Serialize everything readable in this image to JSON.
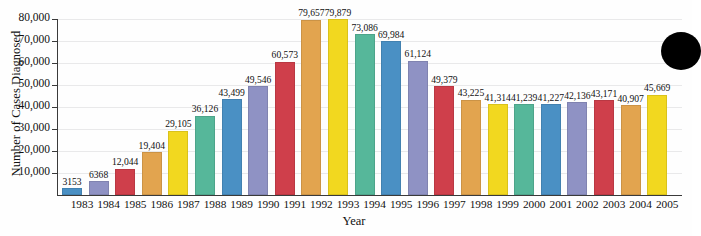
{
  "chart_data": {
    "type": "bar",
    "title": "",
    "xlabel": "Year",
    "ylabel": "Number of Cases Diagnosed",
    "ylim": [
      0,
      80000
    ],
    "ytick_values": [
      10000,
      20000,
      30000,
      40000,
      50000,
      60000,
      70000,
      80000
    ],
    "ytick_labels": [
      "10,000",
      "20,000",
      "30,000",
      "40,000",
      "50,000",
      "60,000",
      "70,000",
      "80,000"
    ],
    "grid": true,
    "legend": "none",
    "categories": [
      "1983",
      "1984",
      "1985",
      "1986",
      "1987",
      "1988",
      "1989",
      "1990",
      "1991",
      "1992",
      "1993",
      "1994",
      "1995",
      "1996",
      "1997",
      "1998",
      "1999",
      "2000",
      "2001",
      "2002",
      "2003",
      "2004",
      "2005"
    ],
    "values": [
      3153,
      6368,
      12044,
      19404,
      29105,
      36126,
      43499,
      49546,
      60573,
      79657,
      79879,
      73086,
      69984,
      61124,
      49379,
      43225,
      41314,
      41239,
      41227,
      42136,
      43171,
      40907,
      45669
    ],
    "value_labels": [
      "3153",
      "6368",
      "12,044",
      "19,404",
      "29,105",
      "36,126",
      "43,499",
      "49,546",
      "60,573",
      "79,657",
      "79,879",
      "73,086",
      "69,984",
      "61,124",
      "49,379",
      "43,225",
      "41,314",
      "41,239",
      "41,227",
      "42,136",
      "43,171",
      "40,907",
      "45,669"
    ],
    "bar_colors": [
      "#4a90c4",
      "#8f92c4",
      "#cf3f4b",
      "#e2a44f",
      "#f2d81f",
      "#56b79a",
      "#4a90c4",
      "#8f92c4",
      "#cf3f4b",
      "#e2a44f",
      "#f2d81f",
      "#56b79a",
      "#4a90c4",
      "#8f92c4",
      "#cf3f4b",
      "#e2a44f",
      "#f2d81f",
      "#56b79a",
      "#4a90c4",
      "#8f92c4",
      "#cf3f4b",
      "#e2a44f",
      "#f2d81f"
    ],
    "palette": {
      "blue": "#4a90c4",
      "purple": "#8f92c4",
      "red": "#cf3f4b",
      "orange": "#e2a44f",
      "yellow": "#f2d81f",
      "teal": "#56b79a",
      "axis": "#3a3a3a",
      "grid": "#e9e9ea",
      "text": "#111111",
      "background": "#ffffff"
    }
  }
}
